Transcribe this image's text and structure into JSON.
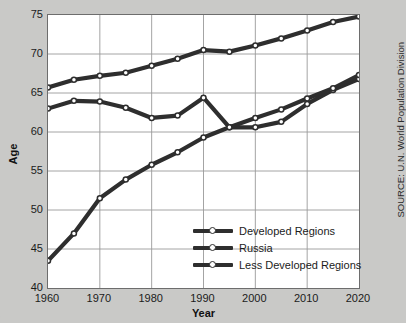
{
  "chart_data": {
    "type": "line",
    "title": "",
    "xlabel": "Year",
    "ylabel": "Age",
    "xlim": [
      1960,
      2020
    ],
    "ylim": [
      40,
      75
    ],
    "xticks": [
      1960,
      1970,
      1980,
      1990,
      2000,
      2010,
      2020
    ],
    "yticks": [
      40,
      45,
      50,
      55,
      60,
      65,
      70,
      75
    ],
    "grid": true,
    "legend_position": "inside-bottom-center",
    "x": [
      1960,
      1965,
      1970,
      1975,
      1980,
      1985,
      1990,
      1995,
      2000,
      2005,
      2010,
      2015,
      2020
    ],
    "series": [
      {
        "name": "Developed Regions",
        "color": "#2e2e2e",
        "values": [
          65.7,
          66.7,
          67.2,
          67.6,
          68.5,
          69.4,
          70.5,
          70.3,
          71.1,
          72.0,
          73.0,
          74.1,
          74.8
        ]
      },
      {
        "name": "Russia",
        "color": "#2e2e2e",
        "values": [
          63.0,
          64.0,
          63.9,
          63.1,
          61.8,
          62.1,
          64.4,
          60.6,
          60.6,
          61.3,
          63.6,
          65.4,
          66.8
        ]
      },
      {
        "name": "Less Developed Regions",
        "color": "#2e2e2e",
        "values": [
          43.5,
          47.0,
          51.5,
          53.9,
          55.8,
          57.4,
          59.3,
          60.6,
          61.8,
          62.9,
          64.3,
          65.6,
          67.3
        ]
      }
    ],
    "source": "SOURCE: U.N. World Population Division"
  },
  "legend": {
    "items": [
      {
        "label": "Developed Regions"
      },
      {
        "label": "Russia"
      },
      {
        "label": "Less Developed Regions"
      }
    ]
  },
  "colors": {
    "background": "#c9c9c7",
    "plot_background": "#ffffff",
    "line": "#2e2e2e",
    "grid": "#9a9a9a",
    "frame": "#6d6d6d",
    "text": "#1b1b1b"
  }
}
